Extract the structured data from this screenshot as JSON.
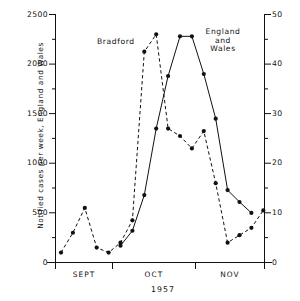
{
  "chart_data": {
    "type": "line",
    "title": "",
    "xlabel": "1957",
    "x_tick_labels": [
      "SEPT",
      "OCT",
      "NOV"
    ],
    "grid": false,
    "legend_position": "inline-annotation",
    "annotations": [
      {
        "text": "Bradford",
        "series": "Bradford"
      },
      {
        "text": "England and Wales",
        "series": "England and Wales"
      }
    ],
    "axes": {
      "left": {
        "label": "Notified cases per week, England and Wales",
        "ticks": [
          0,
          500,
          1000,
          1500,
          2000,
          2500
        ],
        "minor_tick_step": 250,
        "lim": [
          0,
          2500
        ]
      },
      "right": {
        "label": "Notified cases per week, Bradford",
        "ticks": [
          0,
          10,
          20,
          30,
          40,
          50
        ],
        "minor_tick_step": 5,
        "lim": [
          0,
          50
        ]
      }
    },
    "series": [
      {
        "name": "England and Wales",
        "axis": "left",
        "style": "solid",
        "marker": "filled-circle",
        "x": [
          5,
          6,
          7,
          8,
          9,
          10,
          11,
          12,
          13,
          14,
          15,
          16
        ],
        "values": [
          170,
          320,
          680,
          1350,
          1880,
          2280,
          2280,
          1900,
          1450,
          730,
          610,
          500
        ]
      },
      {
        "name": "Bradford",
        "axis": "right",
        "style": "dashed",
        "marker": "filled-circle",
        "x": [
          0,
          1,
          2,
          3,
          4,
          5,
          6,
          7,
          8,
          9,
          10,
          11,
          12,
          13,
          14,
          15,
          16,
          17
        ],
        "values": [
          2,
          6,
          11,
          3,
          2,
          4,
          8.5,
          42.5,
          46,
          27,
          25.5,
          23,
          26.5,
          16,
          4,
          5.5,
          7,
          10.5
        ]
      }
    ]
  },
  "labels": {
    "ytitle_left": "Notified cases per week, England and Wales",
    "ytitle_right": "Notified cases per week, Bradford",
    "xtitle": "1957",
    "bradford": "Bradford",
    "england_line1": "England",
    "england_line2": "and",
    "england_line3": "Wales",
    "yticks_left": [
      "2500",
      "2000",
      "1500",
      "1000",
      "500",
      "0"
    ],
    "yticks_right": [
      "50",
      "40",
      "30",
      "20",
      "10",
      "0"
    ],
    "xticks": [
      "SEPT",
      "OCT",
      "NOV"
    ]
  },
  "colors": {
    "ink": "#111111",
    "background": "#ffffff"
  }
}
